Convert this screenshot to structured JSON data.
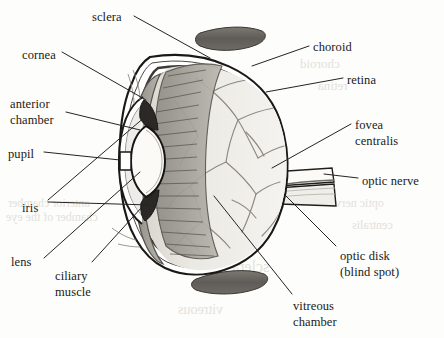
{
  "figure": {
    "style": "grayscale line drawing with leader-line labels",
    "colors": {
      "page_background": "#fdfdfb",
      "ink": "#1a1a18",
      "leader_line": "#2a2a28",
      "sclera_fill": "#ffffff",
      "vitreous_fill": "#eceae4",
      "ciliary_band": "#a3a099",
      "muscle_fill": "#6d6a64",
      "lens_fill": "#fbfaf6",
      "vessel": "#8a877f",
      "bleed_through": "#c9c6bd"
    }
  },
  "labels": [
    {
      "id": "sclera",
      "text": "sclera",
      "x": 92,
      "y": 10,
      "line2": ""
    },
    {
      "id": "cornea",
      "text": "cornea",
      "x": 22,
      "y": 48,
      "line2": ""
    },
    {
      "id": "anterior-chamber",
      "text": "anterior",
      "x": 10,
      "y": 96,
      "line2": "chamber"
    },
    {
      "id": "pupil",
      "text": "pupil",
      "x": 8,
      "y": 147,
      "line2": ""
    },
    {
      "id": "iris",
      "text": "iris",
      "x": 22,
      "y": 201,
      "line2": ""
    },
    {
      "id": "lens",
      "text": "lens",
      "x": 11,
      "y": 255,
      "line2": ""
    },
    {
      "id": "ciliary-muscle",
      "text": "ciliary",
      "x": 55,
      "y": 268,
      "line2": "muscle"
    },
    {
      "id": "choroid",
      "text": "choroid",
      "x": 313,
      "y": 40,
      "line2": ""
    },
    {
      "id": "retina",
      "text": "retina",
      "x": 347,
      "y": 73,
      "line2": ""
    },
    {
      "id": "fovea-centralis",
      "text": "fovea",
      "x": 355,
      "y": 117,
      "line2": "centralis"
    },
    {
      "id": "optic-nerve",
      "text": "optic nerve",
      "x": 362,
      "y": 174,
      "line2": ""
    },
    {
      "id": "optic-disk",
      "text": "optic disk",
      "x": 340,
      "y": 248,
      "line2": "(blind spot)"
    },
    {
      "id": "vitreous-chamber",
      "text": "vitreous",
      "x": 293,
      "y": 298,
      "line2": "chamber"
    }
  ],
  "bleed_through_text": [
    {
      "text": "choroid",
      "x": 300,
      "y": 56,
      "size": 13
    },
    {
      "text": "retina",
      "x": 318,
      "y": 78,
      "size": 13
    },
    {
      "text": "anterior chamber",
      "x": 8,
      "y": 196,
      "size": 12
    },
    {
      "text": "chamber of the eye",
      "x": 6,
      "y": 210,
      "size": 12
    },
    {
      "text": "sclera",
      "x": 232,
      "y": 258,
      "size": 16
    },
    {
      "text": "optic nerve",
      "x": 330,
      "y": 196,
      "size": 12
    },
    {
      "text": "centralis",
      "x": 352,
      "y": 218,
      "size": 12
    },
    {
      "text": "vitreous",
      "x": 178,
      "y": 302,
      "size": 14
    }
  ]
}
